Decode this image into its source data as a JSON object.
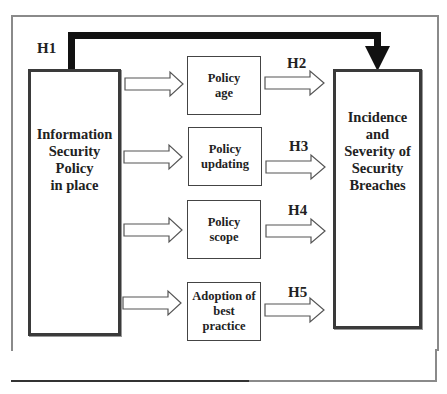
{
  "diagram": {
    "type": "conceptual-model",
    "source_box": {
      "lines": [
        "Information",
        "Security",
        "Policy",
        "in place"
      ]
    },
    "target_box": {
      "lines": [
        "Incidence",
        "and",
        "Severity of",
        "Security",
        "Breaches"
      ]
    },
    "mediators": [
      {
        "lines": [
          "Policy",
          "age"
        ],
        "hypothesis": "H2"
      },
      {
        "lines": [
          "Policy",
          "updating"
        ],
        "hypothesis": "H3"
      },
      {
        "lines": [
          "Policy",
          "scope"
        ],
        "hypothesis": "H4"
      },
      {
        "lines": [
          "Adoption of",
          "best",
          "practice"
        ],
        "hypothesis": "H5"
      }
    ],
    "direct_path": {
      "hypothesis": "H1"
    },
    "colors": {
      "thick_arrow": "#111111",
      "box_border": "#3a3a3a",
      "frame": "#8a8a8a"
    }
  }
}
